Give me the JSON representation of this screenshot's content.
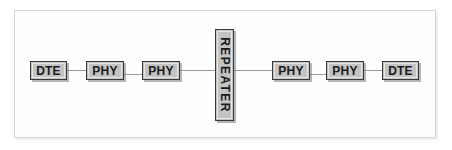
{
  "diagram": {
    "type": "network-topology",
    "colors": {
      "node_fill": "#c3c3c3",
      "node_border": "#3a3a3a",
      "node_highlight": "#e6e6e6",
      "link": "#9a9a9a",
      "frame_border": "#d4d4d4",
      "background": "#ffffff",
      "label_text": "#1a1a1a"
    },
    "nodes": [
      {
        "id": "dte-left",
        "label": "DTE",
        "orientation": "horizontal",
        "x": 30,
        "y": 61,
        "w": 37,
        "h": 19
      },
      {
        "id": "phy-left-1",
        "label": "PHY",
        "orientation": "horizontal",
        "x": 86,
        "y": 61,
        "w": 38,
        "h": 19
      },
      {
        "id": "phy-left-2",
        "label": "PHY",
        "orientation": "horizontal",
        "x": 142,
        "y": 61,
        "w": 38,
        "h": 19
      },
      {
        "id": "repeater",
        "label": "REPEATER",
        "orientation": "vertical",
        "x": 215,
        "y": 29,
        "w": 19,
        "h": 92
      },
      {
        "id": "phy-right-1",
        "label": "PHY",
        "orientation": "horizontal",
        "x": 272,
        "y": 61,
        "w": 38,
        "h": 19
      },
      {
        "id": "phy-right-2",
        "label": "PHY",
        "orientation": "horizontal",
        "x": 326,
        "y": 61,
        "w": 38,
        "h": 19
      },
      {
        "id": "dte-right",
        "label": "DTE",
        "orientation": "horizontal",
        "x": 382,
        "y": 61,
        "w": 37,
        "h": 19
      }
    ],
    "links": [
      {
        "id": "link-dte-left-phy1",
        "from": "dte-left",
        "to": "phy-left-1",
        "x": 67,
        "y": 70,
        "length": 19
      },
      {
        "id": "link-phy1-phy2-left",
        "from": "phy-left-1",
        "to": "phy-left-2",
        "x": 124,
        "y": 74,
        "length": 18
      },
      {
        "id": "link-phy2-repeater",
        "from": "phy-left-2",
        "to": "repeater",
        "x": 180,
        "y": 70,
        "length": 35
      },
      {
        "id": "link-repeater-phy1",
        "from": "repeater",
        "to": "phy-right-1",
        "x": 234,
        "y": 70,
        "length": 38
      },
      {
        "id": "link-phy1-phy2-right",
        "from": "phy-right-1",
        "to": "phy-right-2",
        "x": 310,
        "y": 74,
        "length": 16
      },
      {
        "id": "link-phy2-dte-right",
        "from": "phy-right-2",
        "to": "dte-right",
        "x": 364,
        "y": 70,
        "length": 18
      }
    ]
  }
}
